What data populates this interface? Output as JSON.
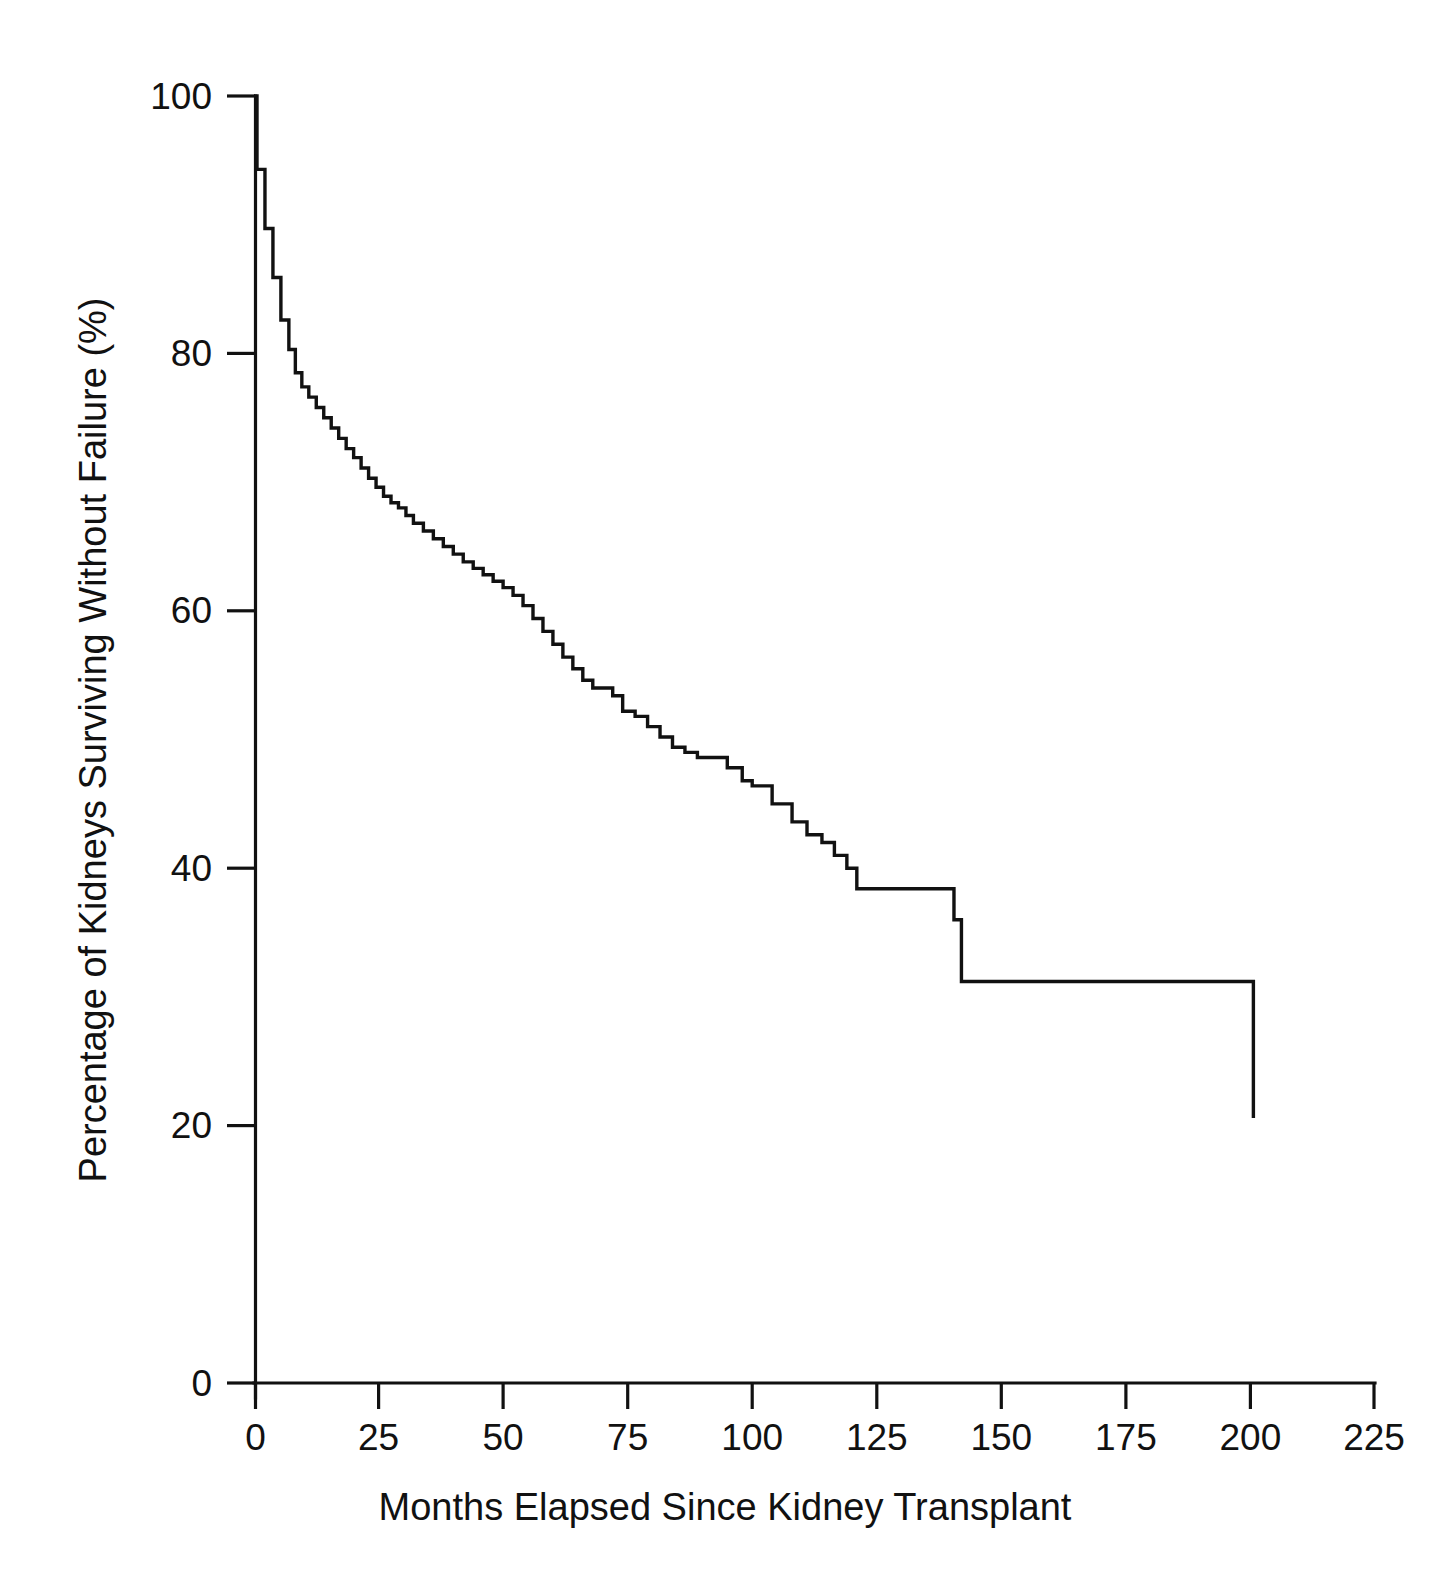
{
  "chart_data": {
    "type": "line",
    "subtype": "kaplan-meier-step",
    "title": "",
    "xlabel": "Months Elapsed Since Kidney Transplant",
    "ylabel": "Percentage of Kidneys Surviving Without Failure (%)",
    "xlim": [
      0,
      225
    ],
    "ylim": [
      0,
      100
    ],
    "xticks": [
      0,
      25,
      50,
      75,
      100,
      125,
      150,
      175,
      200,
      225
    ],
    "xtick_labels": [
      "0",
      "25",
      "50",
      "75",
      "100",
      "125",
      "150",
      "175",
      "200",
      "225"
    ],
    "yticks": [
      0,
      20,
      40,
      60,
      80,
      100
    ],
    "ytick_labels": [
      "0",
      "20",
      "40",
      "60",
      "80",
      "100"
    ],
    "grid": false,
    "legend": false,
    "legend_position": "none",
    "line_color": "#111111",
    "background_color": "#ffffff",
    "series": [
      {
        "name": "Kidney graft survival",
        "x": [
          0,
          0.6,
          2.2,
          3.8,
          5.4,
          7.0,
          8.3,
          9.6,
          11.0,
          12.5,
          14.0,
          15.5,
          17.0,
          18.5,
          20.0,
          21.5,
          23.0,
          24.5,
          26.0,
          27.5,
          29.0,
          30.5,
          32.0,
          34.0,
          36.0,
          38.0,
          40.0,
          42.0,
          44.0,
          46.0,
          48.0,
          50.0,
          52.0,
          54.0,
          56.0,
          58.0,
          60.0,
          62.0,
          64.0,
          66.0,
          68.0,
          70.0,
          72.0,
          74.0,
          76.5,
          79.0,
          81.5,
          84.0,
          86.5,
          89.0,
          92.0,
          95.0,
          98.0,
          100.0,
          104.0,
          108.0,
          111.0,
          114.0,
          116.5,
          119.0,
          121.0,
          124.0,
          127.0,
          137.0,
          140.5,
          142.0,
          184.0,
          200.6
        ],
        "y": [
          100.0,
          94.3,
          89.7,
          85.9,
          82.6,
          80.3,
          78.5,
          77.4,
          76.6,
          75.8,
          75.0,
          74.2,
          73.4,
          72.6,
          71.9,
          71.1,
          70.3,
          69.6,
          68.9,
          68.4,
          68.0,
          67.4,
          66.8,
          66.2,
          65.6,
          65.0,
          64.4,
          63.8,
          63.3,
          62.8,
          62.3,
          61.8,
          61.2,
          60.4,
          59.4,
          58.4,
          57.4,
          56.4,
          55.5,
          54.6,
          54.0,
          54.0,
          53.4,
          52.2,
          51.8,
          51.0,
          50.2,
          49.4,
          49.0,
          48.6,
          48.6,
          47.8,
          46.8,
          46.4,
          45.0,
          43.6,
          42.6,
          42.0,
          41.0,
          40.0,
          38.4,
          38.4,
          38.4,
          38.4,
          36.0,
          31.2,
          31.2,
          20.6
        ],
        "annotations": [
          {
            "label": "steep early attrition",
            "x_range": [
              0,
              10
            ],
            "y_range": [
              78,
              100
            ]
          },
          {
            "label": "plateau at ~38%",
            "x_range": [
              121,
              137
            ],
            "y": 38.4
          },
          {
            "label": "plateau at ~31%",
            "x_range": [
              142,
              184
            ],
            "y": 31.2
          },
          {
            "label": "terminal step to ~21%",
            "x_range": [
              184,
              200.6
            ],
            "y": 20.6
          }
        ]
      }
    ],
    "readings": {
      "survival_at_12_months": 75.8,
      "survival_at_25_months": 70.0,
      "survival_at_50_months": 61.8,
      "survival_at_75_months": 53.4,
      "survival_at_100_months": 46.4,
      "survival_at_125_months": 38.4,
      "survival_at_150_months": 31.2,
      "survival_at_175_months": 31.2,
      "survival_at_200_months": 20.6
    }
  },
  "geometry": {
    "x0_px": 254,
    "x_max_px": 1375,
    "y0_px": 1383,
    "y_top_px": 96,
    "px_per_month": 4.982,
    "px_per_percent": 12.87,
    "tick_length_px": 26,
    "ytick_length_px": 28
  }
}
